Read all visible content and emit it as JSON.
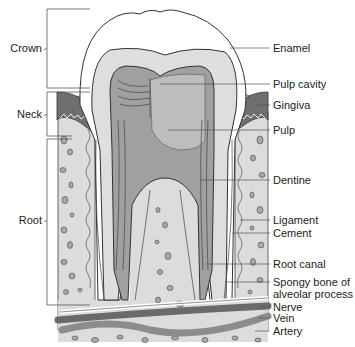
{
  "diagram": {
    "colors": {
      "bone": "#dcdcdc",
      "bone_spots": "#a9a9a9",
      "gingiva": "#6f6f6f",
      "enamel": "#ffffff",
      "dentine": "#dedede",
      "pulp": "#a0a0a0",
      "root_canal": "#c4c4c4",
      "vessel_dark": "#6a6a6a",
      "vessel_mid": "#8c8c8c",
      "nerve": "#ffffff",
      "line": "#333333",
      "leader": "#555555"
    },
    "left_labels": [
      {
        "text": "Crown",
        "y": 48
      },
      {
        "text": "Neck",
        "y": 114
      },
      {
        "text": "Root",
        "y": 220
      }
    ],
    "right_labels": [
      {
        "text": "Enamel",
        "y": 48
      },
      {
        "text": "Pulp cavity",
        "y": 84
      },
      {
        "text": "Gingiva",
        "y": 105
      },
      {
        "text": "Pulp",
        "y": 130
      },
      {
        "text": "Dentine",
        "y": 180
      },
      {
        "text": "Ligament",
        "y": 220
      },
      {
        "text": "Cement",
        "y": 233
      },
      {
        "text": "Root canal",
        "y": 264
      },
      {
        "text": "Spongy bone of",
        "y": 282
      },
      {
        "text": "alveolar process",
        "y": 294
      },
      {
        "text": "Nerve",
        "y": 307
      },
      {
        "text": "Vein",
        "y": 318
      },
      {
        "text": "Artery",
        "y": 331
      }
    ]
  }
}
